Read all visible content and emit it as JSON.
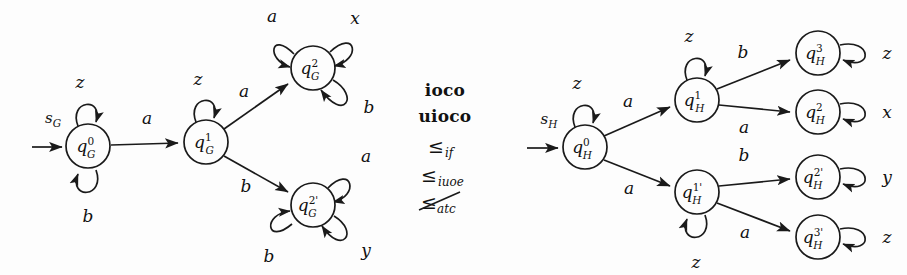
{
  "figure": {
    "background_color": "#fdfdfd",
    "ink_color": "#1a1a1a"
  },
  "automaton_g": {
    "name": "G",
    "start_label": "s",
    "start_sub": "G",
    "states": [
      {
        "id": "q0G",
        "base": "q",
        "sup": "0",
        "sub": "G",
        "cx": 88,
        "cy": 146,
        "r": 22
      },
      {
        "id": "q1G",
        "base": "q",
        "sup": "1",
        "sub": "G",
        "cx": 206,
        "cy": 142,
        "r": 22
      },
      {
        "id": "q2G",
        "base": "q",
        "sup": "2",
        "sub": "G",
        "cx": 313,
        "cy": 68,
        "r": 22
      },
      {
        "id": "q2pG",
        "base": "q",
        "sup": "2'",
        "sub": "G",
        "cx": 313,
        "cy": 205,
        "r": 22
      }
    ],
    "self_loops": [
      {
        "state": "q0G",
        "label": "z",
        "position": "top"
      },
      {
        "state": "q0G",
        "label": "b",
        "position": "bottom"
      },
      {
        "state": "q1G",
        "label": "z",
        "position": "top"
      },
      {
        "state": "q2G",
        "label": "a",
        "position": "top-left"
      },
      {
        "state": "q2G",
        "label": "x",
        "position": "top-right"
      },
      {
        "state": "q2G",
        "label": "b",
        "position": "bottom-right"
      },
      {
        "state": "q2pG",
        "label": "a",
        "position": "top-right"
      },
      {
        "state": "q2pG",
        "label": "b",
        "position": "bottom-left"
      },
      {
        "state": "q2pG",
        "label": "y",
        "position": "bottom-right"
      }
    ],
    "transitions": [
      {
        "from": "q0G",
        "to": "q1G",
        "label": "a"
      },
      {
        "from": "q1G",
        "to": "q2G",
        "label": "a"
      },
      {
        "from": "q1G",
        "to": "q2pG",
        "label": "b"
      }
    ]
  },
  "relations": {
    "items": [
      {
        "text": "ioco",
        "style": "bold",
        "sub": ""
      },
      {
        "text": "uioco",
        "style": "bold",
        "sub": ""
      },
      {
        "symbol": "≤",
        "style": "symbol",
        "sub": "if",
        "crossed": false
      },
      {
        "symbol": "≤",
        "style": "symbol",
        "sub": "iuoe",
        "crossed": false
      },
      {
        "symbol": "≤",
        "style": "symbol",
        "sub": "atc",
        "crossed": true
      }
    ]
  },
  "automaton_h": {
    "name": "H",
    "start_label": "s",
    "start_sub": "H",
    "states": [
      {
        "id": "q0H",
        "base": "q",
        "sup": "0",
        "sub": "H",
        "cx": 585,
        "cy": 147,
        "r": 22
      },
      {
        "id": "q1H",
        "base": "q",
        "sup": "1",
        "sub": "H",
        "cx": 697,
        "cy": 100,
        "r": 22
      },
      {
        "id": "q1pH",
        "base": "q",
        "sup": "1'",
        "sub": "H",
        "cx": 697,
        "cy": 192,
        "r": 22
      },
      {
        "id": "q3H",
        "base": "q",
        "sup": "3",
        "sub": "H",
        "cx": 818,
        "cy": 53,
        "r": 22
      },
      {
        "id": "q2H",
        "base": "q",
        "sup": "2",
        "sub": "H",
        "cx": 818,
        "cy": 112,
        "r": 22
      },
      {
        "id": "q2pH",
        "base": "q",
        "sup": "2'",
        "sub": "H",
        "cx": 818,
        "cy": 177,
        "r": 22
      },
      {
        "id": "q3pH",
        "base": "q",
        "sup": "3'",
        "sub": "H",
        "cx": 818,
        "cy": 237,
        "r": 22
      }
    ],
    "self_loops": [
      {
        "state": "q0H",
        "label": "z",
        "position": "top"
      },
      {
        "state": "q1H",
        "label": "z",
        "position": "top"
      },
      {
        "state": "q1pH",
        "label": "z",
        "position": "bottom"
      },
      {
        "state": "q3H",
        "label": "z",
        "position": "right"
      },
      {
        "state": "q2H",
        "label": "x",
        "position": "right"
      },
      {
        "state": "q2pH",
        "label": "y",
        "position": "right"
      },
      {
        "state": "q3pH",
        "label": "z",
        "position": "right"
      }
    ],
    "transitions": [
      {
        "from": "q0H",
        "to": "q1H",
        "label": "a"
      },
      {
        "from": "q0H",
        "to": "q1pH",
        "label": "a"
      },
      {
        "from": "q1H",
        "to": "q3H",
        "label": "b"
      },
      {
        "from": "q1H",
        "to": "q2H",
        "label": "a"
      },
      {
        "from": "q1pH",
        "to": "q2pH",
        "label": "b"
      },
      {
        "from": "q1pH",
        "to": "q3pH",
        "label": "a"
      }
    ]
  },
  "labels": {
    "g_start": "s",
    "g_start_sub": "G",
    "h_start": "s",
    "h_start_sub": "H",
    "edge_a": "a",
    "edge_b": "b",
    "loop_z": "z",
    "loop_x": "x",
    "loop_y": "y",
    "rel_ioco": "ioco",
    "rel_uioco": "uioco",
    "rel_leq": "≤",
    "sub_if": "if",
    "sub_iuoe": "iuoe",
    "sub_atc": "atc"
  }
}
